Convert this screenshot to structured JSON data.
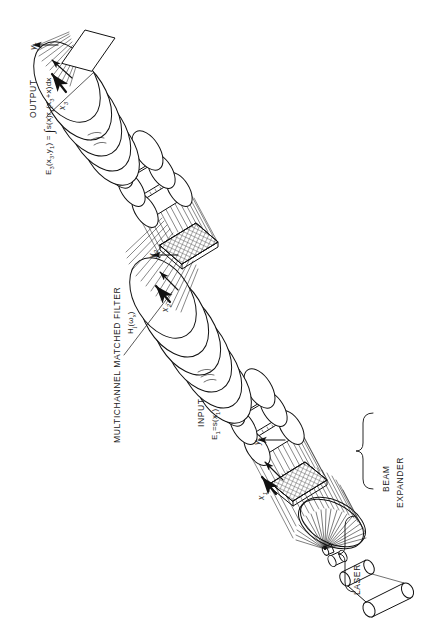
{
  "figure": {
    "domain_title": "Optical multichannel matched filter correlator schematic",
    "background": "#ffffff",
    "ink": "#111111"
  },
  "labels": {
    "output_caption": "OUTPUT",
    "output_equation_prefix": "E",
    "output_equation": "E₃(x₃,y₁) = ∫s(x)r₁(x₃+x)dx",
    "filter_caption": "MULTICHANNEL MATCHED FILTER",
    "filter_equation": "Hⱼ(ωₓ)",
    "input_caption": "INPUT",
    "input_equation": "E₁=s(x₁)",
    "beam_expander": "BEAM EXPANDER",
    "beam_expander_line1": "BEAM",
    "beam_expander_line2": "EXPANDER",
    "laser": "LASER"
  },
  "axes": [
    {
      "id": "y1-output",
      "text": "y₁"
    },
    {
      "id": "x3-output",
      "text": "x₃"
    },
    {
      "id": "y2-filter",
      "text": "y₂"
    },
    {
      "id": "x2-filter",
      "text": "x₂"
    },
    {
      "id": "y1-input",
      "text": "y₁"
    },
    {
      "id": "x1-input",
      "text": "x₁"
    }
  ],
  "components": [
    {
      "id": "laser-tube",
      "name": "laser"
    },
    {
      "id": "spatial-filter",
      "name": "pinhole spatial filter"
    },
    {
      "id": "collimating-lens",
      "name": "beam expander lens"
    },
    {
      "id": "input-transparency",
      "name": "input transparency"
    },
    {
      "id": "lens-group-1",
      "name": "first lens group"
    },
    {
      "id": "matched-filter-plate",
      "name": "multichannel matched filter"
    },
    {
      "id": "lens-group-2",
      "name": "second lens group"
    },
    {
      "id": "output-plane",
      "name": "output plane"
    }
  ]
}
